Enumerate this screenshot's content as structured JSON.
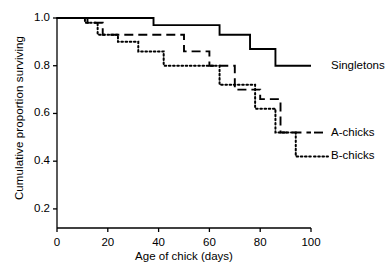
{
  "chart_data": {
    "type": "line",
    "title": "",
    "subtitle": "",
    "xlabel": "Age of chick (days)",
    "ylabel": "Cumulative proportion surviving",
    "xlim": [
      0,
      100
    ],
    "ylim": [
      0.12,
      1.0
    ],
    "xticks": [
      0,
      20,
      40,
      60,
      80,
      100
    ],
    "xtick_labels": [
      "0",
      "20",
      "40",
      "60",
      "80",
      "100"
    ],
    "yticks": [
      0.2,
      0.4,
      0.6,
      0.8,
      1.0
    ],
    "ytick_labels": [
      "0.2",
      "0.4",
      "0.6",
      "0.8",
      "1.0"
    ],
    "grid": false,
    "legend_position": "right-inline",
    "step_style": "post",
    "series": [
      {
        "name": "Singletons",
        "style": "solid",
        "color": "#000000",
        "x": [
          0,
          12,
          14,
          36,
          38,
          62,
          64,
          74,
          76,
          84,
          86,
          100
        ],
        "y": [
          1.0,
          1.0,
          1.0,
          1.0,
          0.97,
          0.97,
          0.93,
          0.93,
          0.87,
          0.87,
          0.8,
          0.8
        ]
      },
      {
        "name": "A-chicks",
        "style": "dashed",
        "color": "#000000",
        "x": [
          0,
          10,
          12,
          16,
          18,
          36,
          38,
          48,
          50,
          58,
          60,
          68,
          70,
          78,
          80,
          86,
          88,
          100
        ],
        "y": [
          1.0,
          1.0,
          0.98,
          0.98,
          0.93,
          0.93,
          0.93,
          0.93,
          0.86,
          0.86,
          0.8,
          0.8,
          0.7,
          0.7,
          0.66,
          0.66,
          0.52,
          0.52
        ]
      },
      {
        "name": "B-chicks",
        "style": "dotted",
        "color": "#000000",
        "x": [
          0,
          9,
          11,
          14,
          16,
          22,
          24,
          30,
          32,
          40,
          42,
          52,
          54,
          62,
          64,
          76,
          78,
          84,
          86,
          92,
          94,
          100
        ],
        "y": [
          1.0,
          1.0,
          0.98,
          0.98,
          0.93,
          0.93,
          0.9,
          0.9,
          0.86,
          0.86,
          0.8,
          0.8,
          0.8,
          0.8,
          0.72,
          0.72,
          0.62,
          0.62,
          0.52,
          0.52,
          0.42,
          0.42
        ]
      }
    ],
    "legend_entries": [
      {
        "label": "Singletons",
        "style": "solid"
      },
      {
        "label": "A-chicks",
        "style": "dashed"
      },
      {
        "label": "B-chicks",
        "style": "dotted"
      }
    ]
  }
}
